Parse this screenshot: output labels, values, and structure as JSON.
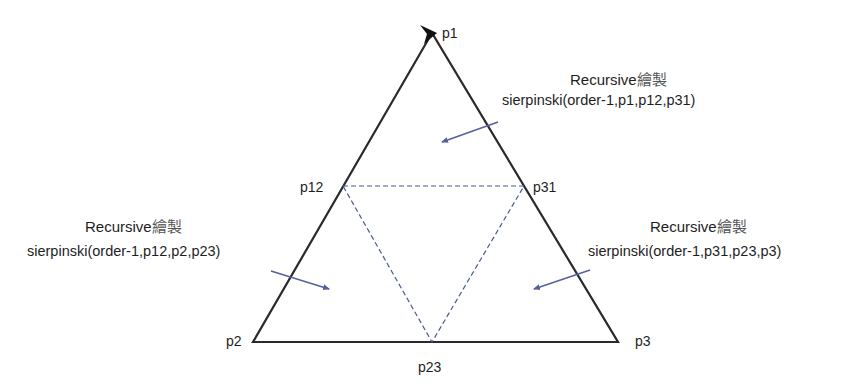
{
  "diagram": {
    "colors": {
      "triangle_stroke": "#2a2a2a",
      "dashed_stroke": "#4a5a9a",
      "arrow_stroke": "#55609e",
      "text": "#1e1e1e"
    },
    "points": {
      "p1": "p1",
      "p2": "p2",
      "p3": "p3",
      "p12": "p12",
      "p23": "p23",
      "p31": "p31"
    },
    "annotations": {
      "top": {
        "heading": "Recursive",
        "heading_cjk": "繪製",
        "call": "sierpinski(order-1,p1,p12,p31)"
      },
      "left": {
        "heading": "Recursive",
        "heading_cjk": "繪製",
        "call": "sierpinski(order-1,p12,p2,p23)"
      },
      "right": {
        "heading": "Recursive",
        "heading_cjk": "繪製",
        "call": "sierpinski(order-1,p31,p23,p3)"
      }
    }
  }
}
